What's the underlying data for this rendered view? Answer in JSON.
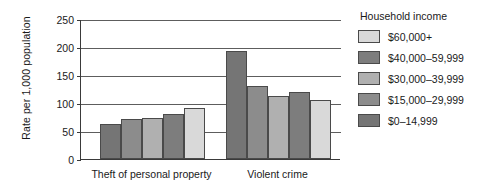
{
  "chart_data": {
    "type": "bar",
    "title": "",
    "xlabel": "",
    "ylabel": "Rate per 1,000 population",
    "ylim": [
      0,
      250
    ],
    "yticks": [
      0,
      50,
      100,
      150,
      200,
      250
    ],
    "ytick_labels": [
      "0",
      "50",
      "100",
      "150",
      "200",
      "250"
    ],
    "grid": true,
    "legend_position": "right",
    "legend_title": "Household income",
    "categories": [
      "Theft of personal property",
      "Violent crime"
    ],
    "series": [
      {
        "name": "$0–14,999",
        "color": "#757575",
        "values": [
          63,
          192
        ]
      },
      {
        "name": "$15,000–29,999",
        "color": "#8c8c8c",
        "values": [
          71,
          130
        ]
      },
      {
        "name": "$30,000–39,999",
        "color": "#b0b0b0",
        "values": [
          73,
          113
        ]
      },
      {
        "name": "$40,000–59,999",
        "color": "#7d7d7d",
        "values": [
          81,
          119
        ]
      },
      {
        "name": "$60,000+",
        "color": "#d9d9d9",
        "values": [
          91,
          106
        ]
      }
    ],
    "legend_order": [
      {
        "name": "$60,000+",
        "color": "#d9d9d9"
      },
      {
        "name": "$40,000–59,999",
        "color": "#7d7d7d"
      },
      {
        "name": "$30,000–39,999",
        "color": "#b0b0b0"
      },
      {
        "name": "$15,000–29,999",
        "color": "#8c8c8c"
      },
      {
        "name": "$0–14,999",
        "color": "#757575"
      }
    ]
  }
}
